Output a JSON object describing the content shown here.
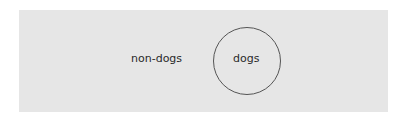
{
  "diagram": {
    "background_color": "#e6e6e6",
    "outer_region_label": "non-dogs",
    "circle_label": "dogs"
  }
}
